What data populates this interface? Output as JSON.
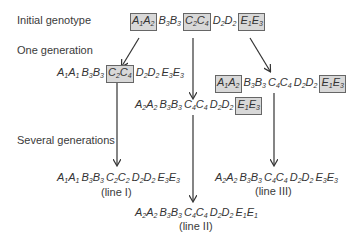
{
  "labels": {
    "initial": "Initial genotype",
    "one_gen": "One generation",
    "several_gen": "Several generations"
  },
  "colors": {
    "box_fill": "#d8d8d8",
    "box_border": "#666666",
    "arrow": "#333333"
  },
  "genotypes": {
    "initial": [
      {
        "a1": "A",
        "s1": "1",
        "a2": "A",
        "s2": "2",
        "boxed": true
      },
      {
        "a1": "B",
        "s1": "3",
        "a2": "B",
        "s2": "3",
        "boxed": false
      },
      {
        "a1": "C",
        "s1": "2",
        "a2": "C",
        "s2": "4",
        "boxed": true
      },
      {
        "a1": "D",
        "s1": "2",
        "a2": "D",
        "s2": "2",
        "boxed": false
      },
      {
        "a1": "E",
        "s1": "1",
        "a2": "E",
        "s2": "3",
        "boxed": true
      }
    ],
    "gen1_left": [
      {
        "a1": "A",
        "s1": "1",
        "a2": "A",
        "s2": "1",
        "boxed": false
      },
      {
        "a1": "B",
        "s1": "3",
        "a2": "B",
        "s2": "3",
        "boxed": false
      },
      {
        "a1": "C",
        "s1": "2",
        "a2": "C",
        "s2": "4",
        "boxed": true
      },
      {
        "a1": "D",
        "s1": "2",
        "a2": "D",
        "s2": "2",
        "boxed": false
      },
      {
        "a1": "E",
        "s1": "3",
        "a2": "E",
        "s2": "3",
        "boxed": false
      }
    ],
    "gen1_middle": [
      {
        "a1": "A",
        "s1": "2",
        "a2": "A",
        "s2": "2",
        "boxed": false
      },
      {
        "a1": "B",
        "s1": "3",
        "a2": "B",
        "s2": "3",
        "boxed": false
      },
      {
        "a1": "C",
        "s1": "4",
        "a2": "C",
        "s2": "4",
        "boxed": false
      },
      {
        "a1": "D",
        "s1": "2",
        "a2": "D",
        "s2": "2",
        "boxed": false
      },
      {
        "a1": "E",
        "s1": "1",
        "a2": "E",
        "s2": "3",
        "boxed": true
      }
    ],
    "gen1_right": [
      {
        "a1": "A",
        "s1": "1",
        "a2": "A",
        "s2": "2",
        "boxed": true
      },
      {
        "a1": "B",
        "s1": "3",
        "a2": "B",
        "s2": "3",
        "boxed": false
      },
      {
        "a1": "C",
        "s1": "4",
        "a2": "C",
        "s2": "4",
        "boxed": false
      },
      {
        "a1": "D",
        "s1": "2",
        "a2": "D",
        "s2": "2",
        "boxed": false
      },
      {
        "a1": "E",
        "s1": "1",
        "a2": "E",
        "s2": "3",
        "boxed": true
      }
    ],
    "line1": [
      {
        "a1": "A",
        "s1": "1",
        "a2": "A",
        "s2": "1",
        "boxed": false
      },
      {
        "a1": "B",
        "s1": "3",
        "a2": "B",
        "s2": "3",
        "boxed": false
      },
      {
        "a1": "C",
        "s1": "2",
        "a2": "C",
        "s2": "2",
        "boxed": false
      },
      {
        "a1": "D",
        "s1": "2",
        "a2": "D",
        "s2": "2",
        "boxed": false
      },
      {
        "a1": "E",
        "s1": "3",
        "a2": "E",
        "s2": "3",
        "boxed": false
      }
    ],
    "line2": [
      {
        "a1": "A",
        "s1": "2",
        "a2": "A",
        "s2": "2",
        "boxed": false
      },
      {
        "a1": "B",
        "s1": "3",
        "a2": "B",
        "s2": "3",
        "boxed": false
      },
      {
        "a1": "C",
        "s1": "4",
        "a2": "C",
        "s2": "4",
        "boxed": false
      },
      {
        "a1": "D",
        "s1": "2",
        "a2": "D",
        "s2": "2",
        "boxed": false
      },
      {
        "a1": "E",
        "s1": "1",
        "a2": "E",
        "s2": "1",
        "boxed": false
      }
    ],
    "line3": [
      {
        "a1": "A",
        "s1": "2",
        "a2": "A",
        "s2": "2",
        "boxed": false
      },
      {
        "a1": "B",
        "s1": "3",
        "a2": "B",
        "s2": "3",
        "boxed": false
      },
      {
        "a1": "C",
        "s1": "4",
        "a2": "C",
        "s2": "4",
        "boxed": false
      },
      {
        "a1": "D",
        "s1": "2",
        "a2": "D",
        "s2": "2",
        "boxed": false
      },
      {
        "a1": "E",
        "s1": "3",
        "a2": "E",
        "s2": "3",
        "boxed": false
      }
    ]
  },
  "line_labels": {
    "line1": "(line I)",
    "line2": "(line II)",
    "line3": "(line III)"
  }
}
